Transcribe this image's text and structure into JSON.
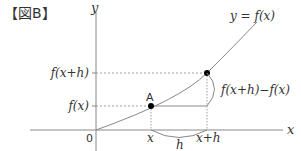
{
  "figure_label": "【図B】",
  "axes": {
    "x_label": "x",
    "y_label": "y",
    "origin_label": "0"
  },
  "curve_label": "y = f(x)",
  "y_ticks": {
    "upper": "f(x+h)",
    "lower": "f(x)"
  },
  "x_ticks": {
    "left": "x",
    "right": "x+h"
  },
  "point_label": "A",
  "interval_label": "h",
  "difference_label": "f(x+h)−f(x)",
  "colors": {
    "line": "#888888",
    "text": "#333333",
    "point": "#000000"
  }
}
